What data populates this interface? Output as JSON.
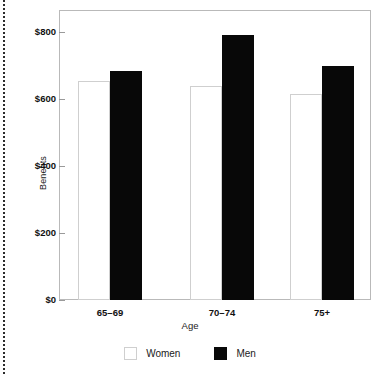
{
  "figure": {
    "binding_edge": "dotted-page-binding-edge"
  },
  "chart_data": {
    "type": "bar",
    "title": "",
    "subtitle": "",
    "categories": [
      "65–69",
      "70–74",
      "75+"
    ],
    "series": [
      {
        "name": "Women",
        "values": [
          655,
          640,
          615
        ],
        "color": "#ffffff",
        "border_color": "#cfcfcf"
      },
      {
        "name": "Men",
        "values": [
          685,
          790,
          700
        ],
        "color": "#080808",
        "border_color": "#080808"
      }
    ],
    "xlabel": "Age",
    "ylabel": "Benefits",
    "ylim": [
      0,
      840
    ],
    "yticks": [
      0,
      200,
      400,
      600,
      800
    ],
    "ytick_labels": [
      "$0",
      "$200",
      "$400",
      "$600",
      "$800"
    ],
    "grid": false,
    "legend_position": "bottom",
    "legend_entries": [
      "Women",
      "Men"
    ]
  },
  "axes": {
    "y_title": "Benefits",
    "x_title": "Age",
    "y_tick_labels": [
      "$800",
      "$600",
      "$400",
      "$200",
      "$0"
    ],
    "x_tick_labels": [
      "65–69",
      "70–74",
      "75+"
    ]
  },
  "legend": {
    "items": [
      {
        "label": "Women",
        "swatch": "open-square-swatch"
      },
      {
        "label": "Men",
        "swatch": "filled-square-swatch"
      }
    ]
  }
}
